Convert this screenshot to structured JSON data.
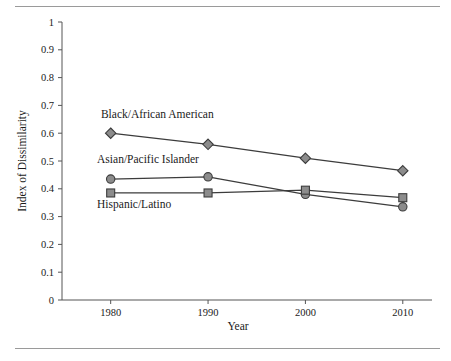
{
  "chart_data": {
    "type": "line",
    "title": "",
    "xlabel": "Year",
    "ylabel": "Index of Dissimilarity",
    "x": [
      1980,
      1990,
      2000,
      2010
    ],
    "xtick_labels": [
      "1980",
      "1990",
      "2000",
      "2010"
    ],
    "ytick_labels": [
      "0",
      "0.1",
      "0.2",
      "0.3",
      "0.4",
      "0.5",
      "0.6",
      "0.7",
      "0.8",
      "0.9",
      "1"
    ],
    "ylim": [
      0,
      1
    ],
    "xlim": [
      1975,
      2013
    ],
    "grid": false,
    "legend_position": "inline-annotations",
    "series": [
      {
        "name": "Black/African American",
        "marker": "diamond",
        "color": "#8c8c8c",
        "values": [
          0.6,
          0.56,
          0.51,
          0.465
        ]
      },
      {
        "name": "Asian/Pacific Islander",
        "marker": "circle",
        "color": "#8c8c8c",
        "values": [
          0.435,
          0.443,
          0.38,
          0.335
        ]
      },
      {
        "name": "Hispanic/Latino",
        "marker": "square",
        "color": "#8c8c8c",
        "values": [
          0.385,
          0.385,
          0.395,
          0.368
        ]
      }
    ],
    "annotations": [
      {
        "text": "Black/African American",
        "x": 1979.0,
        "y": 0.655
      },
      {
        "text": "Asian/Pacific Islander",
        "x": 1978.6,
        "y": 0.492
      },
      {
        "text": "Hispanic/Latino",
        "x": 1978.6,
        "y": 0.332
      }
    ],
    "colors": {
      "line": "#3c3c3c",
      "marker_fill": "#8c8c8c",
      "marker_stroke": "#3c3c3c",
      "axis": "#555555",
      "rule": "#9a9a9a",
      "text": "#1a1a1a",
      "background": "#ffffff"
    }
  }
}
